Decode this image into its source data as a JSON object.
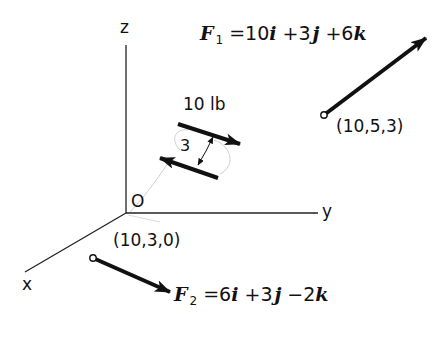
{
  "axes": {
    "z_label": "z",
    "y_label": "y",
    "x_label": "x",
    "origin_label": "O"
  },
  "force1": {
    "symbol": "F",
    "subscript": "1",
    "equals": "=",
    "c1": "10",
    "u1": "i",
    "op1": "+",
    "c2": "3",
    "u2": "j",
    "op2": "+",
    "c3": "6",
    "u3": "k",
    "point_label": "(10,5,3)"
  },
  "force2": {
    "symbol": "F",
    "subscript": "2",
    "equals": "=",
    "c1": "6",
    "u1": "i",
    "op1": "+",
    "c2": "3",
    "u2": "j",
    "op2": "−",
    "c3": "2",
    "u3": "k",
    "point_label": "(10,3,0)"
  },
  "couple": {
    "magnitude_label": "10 lb",
    "arm_label": "3"
  },
  "colors": {
    "ink": "#111111",
    "faint": "#c8c8c8",
    "background": "#ffffff"
  }
}
